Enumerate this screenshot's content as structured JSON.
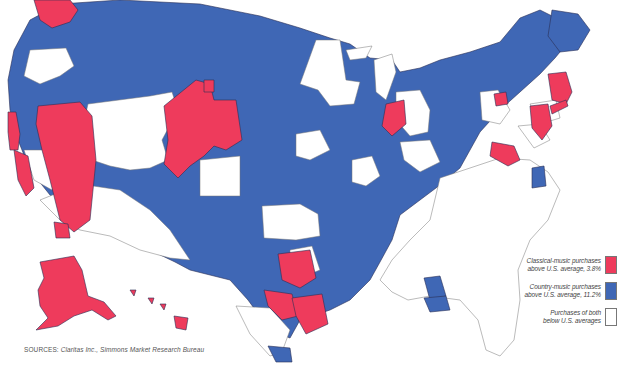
{
  "map": {
    "title": "U.S. Classical vs. Country Music Purchases by Market",
    "colors": {
      "classical": "#ee3b5c",
      "country": "#3f67b5",
      "neither": "#ffffff",
      "border": "#2a2f55"
    }
  },
  "legend": {
    "items": [
      {
        "label_line1": "Classical-music purchases",
        "label_line2": "above U.S. average, 3.8%",
        "swatch": "classical"
      },
      {
        "label_line1": "Country-music purchases",
        "label_line2": "above U.S. average, 11.2%",
        "swatch": "country"
      },
      {
        "label_line1": "Purchases of both",
        "label_line2": "below U.S. averages",
        "swatch": "neither"
      }
    ]
  },
  "source": {
    "prefix": "SOURCES:",
    "text": "Claritas Inc., Simmons Market Research Bureau"
  }
}
